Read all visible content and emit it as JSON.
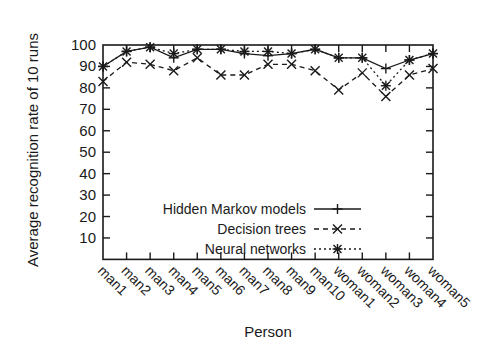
{
  "chart_data": {
    "type": "line",
    "title": "",
    "xlabel": "Person",
    "ylabel": "Average recognition rate of 10 runs",
    "categories": [
      "man1",
      "man2",
      "man3",
      "man4",
      "man5",
      "man6",
      "man7",
      "man8",
      "man9",
      "man10",
      "woman1",
      "woman2",
      "woman3",
      "woman4",
      "woman5"
    ],
    "ylim": [
      0,
      100
    ],
    "yticks": [
      10,
      20,
      30,
      40,
      50,
      60,
      70,
      80,
      90,
      100
    ],
    "grid": false,
    "legend_position": "bottom-right",
    "series": [
      {
        "name": "Hidden Markov models",
        "style": "solid",
        "marker": "plus",
        "values": [
          90,
          97,
          99,
          94,
          98,
          98,
          96,
          95,
          96,
          98,
          94,
          94,
          89,
          93,
          96
        ]
      },
      {
        "name": "Decision trees",
        "style": "dashed",
        "marker": "x",
        "values": [
          83,
          92,
          91,
          88,
          94,
          86,
          86,
          91,
          91,
          88,
          79,
          87,
          76,
          86,
          89
        ]
      },
      {
        "name": "Neural networks",
        "style": "dotted",
        "marker": "star",
        "values": [
          90,
          97,
          99,
          96,
          98,
          98,
          97,
          97,
          96,
          98,
          94,
          94,
          81,
          93,
          96
        ]
      }
    ]
  }
}
